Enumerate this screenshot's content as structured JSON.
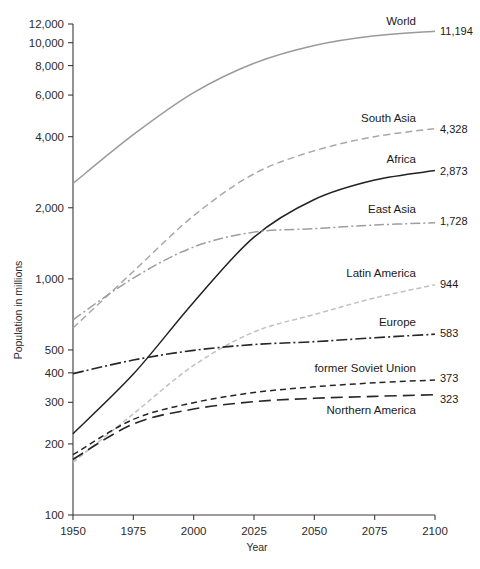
{
  "chart_data": {
    "type": "line",
    "title": "",
    "xlabel": "Year",
    "ylabel": "Population in millions",
    "yscale": "log",
    "ylim": [
      100,
      12000
    ],
    "xlim": [
      1950,
      2100
    ],
    "grid": false,
    "legend_position": "right-inline-labels",
    "xticks": [
      1950,
      1975,
      2000,
      2025,
      2050,
      2075,
      2100
    ],
    "xtick_labels": [
      "1950",
      "1975",
      "2000",
      "2025",
      "2050",
      "2075",
      "2100"
    ],
    "yticks": [
      100,
      200,
      300,
      400,
      500,
      1000,
      2000,
      4000,
      6000,
      8000,
      10000,
      12000
    ],
    "ytick_labels": [
      "100",
      "200",
      "300",
      "400",
      "500",
      "1,000",
      "2,000",
      "4,000",
      "6,000",
      "8,000",
      "10,000",
      "12,000"
    ],
    "x": [
      1950,
      1975,
      2000,
      2025,
      2050,
      2075,
      2100
    ],
    "series": [
      {
        "name": "World",
        "label": "World",
        "end_value_label": "11,194",
        "end_value": 11194,
        "color": "#9a9a9a",
        "dash": "none",
        "width": 1.5,
        "values": [
          2536,
          4079,
          6145,
          8184,
          9735,
          10703,
          11194
        ]
      },
      {
        "name": "South Asia",
        "label": "South Asia",
        "end_value_label": "4,328",
        "end_value": 4328,
        "color": "#a8a8a8",
        "dash": "7,4",
        "width": 1.5,
        "values": [
          619,
          1075,
          1850,
          2784,
          3486,
          4001,
          4328
        ]
      },
      {
        "name": "Africa",
        "label": "Africa",
        "end_value_label": "2,873",
        "end_value": 2873,
        "color": "#222222",
        "dash": "none",
        "width": 1.5,
        "values": [
          221,
          395,
          796,
          1502,
          2168,
          2621,
          2873
        ]
      },
      {
        "name": "East Asia",
        "label": "East Asia",
        "end_value_label": "1,728",
        "end_value": 1728,
        "color": "#9e9e9e",
        "dash": "10,3,2,3",
        "width": 1.5,
        "values": [
          671,
          1008,
          1364,
          1577,
          1631,
          1690,
          1728
        ]
      },
      {
        "name": "Latin America",
        "label": "Latin America",
        "end_value_label": "944",
        "end_value": 944,
        "color": "#c0c0c0",
        "dash": "5,3",
        "width": 1.5,
        "values": [
          167,
          268,
          430,
          596,
          706,
          830,
          944
        ]
      },
      {
        "name": "Europe",
        "label": "Europe",
        "end_value_label": "583",
        "end_value": 583,
        "color": "#262626",
        "dash": "11,3,2,3",
        "width": 1.6,
        "values": [
          397,
          453,
          498,
          527,
          542,
          563,
          583
        ]
      },
      {
        "name": "former Soviet Union",
        "label": "former Soviet Union",
        "end_value_label": "373",
        "end_value": 373,
        "color": "#262626",
        "dash": "6,4",
        "width": 1.5,
        "values": [
          180,
          254,
          299,
          330,
          349,
          363,
          373
        ]
      },
      {
        "name": "Northern America",
        "label": "Northern America",
        "end_value_label": "323",
        "end_value": 323,
        "color": "#262626",
        "dash": "12,6",
        "width": 1.6,
        "values": [
          172,
          243,
          281,
          302,
          312,
          318,
          323
        ]
      }
    ],
    "label_anchors": [
      {
        "name": "World",
        "label_x": 416,
        "label_y": 25,
        "value_x": 440,
        "value_y": 35
      },
      {
        "name": "South Asia",
        "label_x": 416,
        "label_y": 122,
        "value_x": 440,
        "value_y": 133
      },
      {
        "name": "Africa",
        "label_x": 416,
        "label_y": 163,
        "value_x": 440,
        "value_y": 175
      },
      {
        "name": "East Asia",
        "label_x": 416,
        "label_y": 213,
        "value_x": 440,
        "value_y": 225
      },
      {
        "name": "Latin America",
        "label_x": 416,
        "label_y": 277,
        "value_x": 440,
        "value_y": 288
      },
      {
        "name": "Europe",
        "label_x": 416,
        "label_y": 326,
        "value_x": 440,
        "value_y": 337
      },
      {
        "name": "former Soviet Union",
        "label_x": 416,
        "label_y": 372,
        "value_x": 440,
        "value_y": 382
      },
      {
        "name": "Northern America",
        "label_x": 416,
        "label_y": 414,
        "value_x": 440,
        "value_y": 403
      }
    ]
  }
}
